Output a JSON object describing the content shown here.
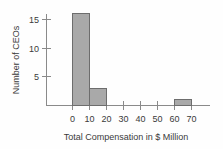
{
  "chart_data": {
    "type": "bar",
    "title": "",
    "subtitle": "",
    "xlabel": "Total Compensation in $ Million",
    "ylabel": "Number of CEOs",
    "xtick_labels": [
      "0",
      "10",
      "20",
      "30",
      "40",
      "50",
      "60",
      "70"
    ],
    "xtick_values": [
      0,
      10,
      20,
      30,
      40,
      50,
      60,
      70
    ],
    "ytick_labels": [
      "5",
      "10",
      "15"
    ],
    "ytick_values": [
      5,
      10,
      15
    ],
    "xlim": [
      0,
      70
    ],
    "ylim": [
      0,
      16
    ],
    "grid": false,
    "legend": false,
    "legend_position": "none",
    "bin_width": 10,
    "bin_edges": [
      0,
      10,
      20,
      60,
      70
    ],
    "categories": [
      "0-10",
      "10-20",
      "60-70"
    ],
    "bins": [
      {
        "label": "0-10",
        "start": 0,
        "end": 10,
        "value": 16
      },
      {
        "label": "10-20",
        "start": 10,
        "end": 20,
        "value": 3
      },
      {
        "label": "60-70",
        "start": 60,
        "end": 70,
        "value": 1
      }
    ],
    "values": [
      16,
      3,
      1
    ],
    "colors": {
      "bar_fill": "#a9a9a9",
      "bar_stroke": "#6d6d6d",
      "axis": "#8a8a8a",
      "text": "#3a3a3a",
      "background": "#fefefe"
    }
  }
}
